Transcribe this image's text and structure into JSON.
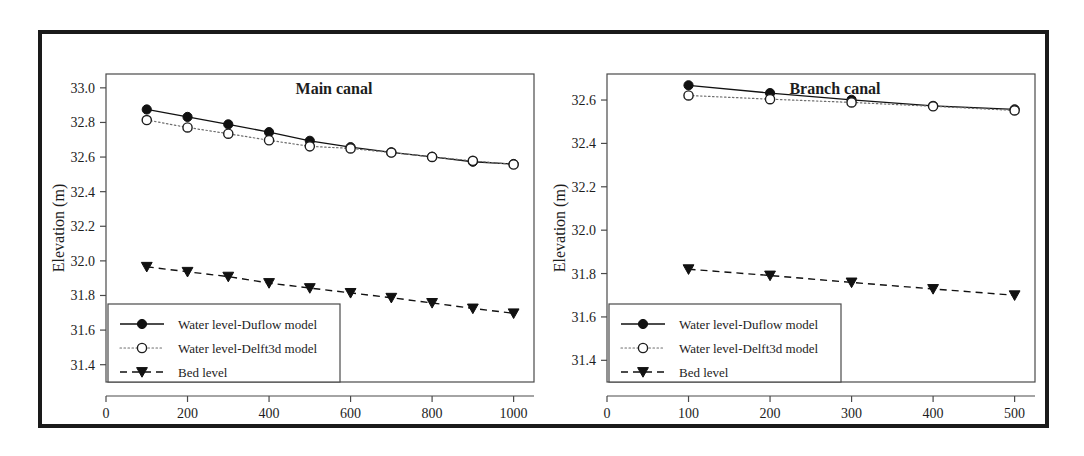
{
  "figure": {
    "panel_count": 2,
    "frame_color": "#1a1a1a",
    "background": "#ffffff"
  },
  "legend": {
    "entries": [
      {
        "label": "Water level-Duflow model",
        "style": "solid",
        "marker": "filled-circle",
        "color": "#111111"
      },
      {
        "label": "Water level-Delft3d model",
        "style": "dotted",
        "marker": "open-circle",
        "color": "#6e6e6e"
      },
      {
        "label": "Bed level",
        "style": "dashed",
        "marker": "filled-triangle-down",
        "color": "#111111"
      }
    ]
  },
  "chart_data": [
    {
      "type": "line",
      "title": "Main canal",
      "xlabel": "Distance (m)",
      "ylabel": "Elevation (m)",
      "xlim": [
        0,
        1050
      ],
      "ylim": [
        31.3,
        33.08
      ],
      "xticks": [
        0,
        200,
        400,
        600,
        800,
        1000
      ],
      "yticks": [
        31.4,
        31.6,
        31.8,
        32.0,
        32.2,
        32.4,
        32.6,
        32.8,
        33.0
      ],
      "xticklabels": [
        "0",
        "200",
        "400",
        "600",
        "800",
        "1000"
      ],
      "yticklabels": [
        "31.4",
        "31.6",
        "31.8",
        "32.0",
        "32.2",
        "32.4",
        "32.6",
        "32.8",
        "33.0"
      ],
      "grid": false,
      "legend_position": "lower-left",
      "x": [
        100,
        200,
        300,
        400,
        500,
        600,
        700,
        800,
        900,
        1000
      ],
      "series": [
        {
          "name": "Water level-Duflow model",
          "values": [
            32.875,
            32.832,
            32.789,
            32.744,
            32.694,
            32.657,
            32.627,
            32.601,
            32.573,
            32.56
          ]
        },
        {
          "name": "Water level-Delft3d model",
          "values": [
            32.814,
            32.771,
            32.735,
            32.697,
            32.662,
            32.65,
            32.626,
            32.601,
            32.578,
            32.557
          ]
        },
        {
          "name": "Bed level",
          "values": [
            31.966,
            31.937,
            31.909,
            31.872,
            31.843,
            31.815,
            31.787,
            31.757,
            31.725,
            31.697
          ]
        }
      ]
    },
    {
      "type": "line",
      "title": "Branch canal",
      "xlabel": "Distance (m)",
      "ylabel": "Elevation (m)",
      "xlim": [
        0,
        525
      ],
      "ylim": [
        31.3,
        32.72
      ],
      "xticks": [
        0,
        100,
        200,
        300,
        400,
        500
      ],
      "yticks": [
        31.4,
        31.6,
        31.8,
        32.0,
        32.2,
        32.4,
        32.6
      ],
      "xticklabels": [
        "0",
        "100",
        "200",
        "300",
        "400",
        "500"
      ],
      "yticklabels": [
        "31.4",
        "31.6",
        "31.8",
        "32.0",
        "32.2",
        "32.4",
        "32.6"
      ],
      "grid": false,
      "legend_position": "lower-left",
      "x": [
        100,
        200,
        300,
        400,
        500
      ],
      "series": [
        {
          "name": "Water level-Duflow model",
          "values": [
            32.668,
            32.632,
            32.601,
            32.573,
            32.557
          ]
        },
        {
          "name": "Water level-Delft3d model",
          "values": [
            32.621,
            32.604,
            32.589,
            32.571,
            32.552
          ]
        },
        {
          "name": "Bed level",
          "values": [
            31.82,
            31.791,
            31.759,
            31.729,
            31.7
          ]
        }
      ]
    }
  ]
}
